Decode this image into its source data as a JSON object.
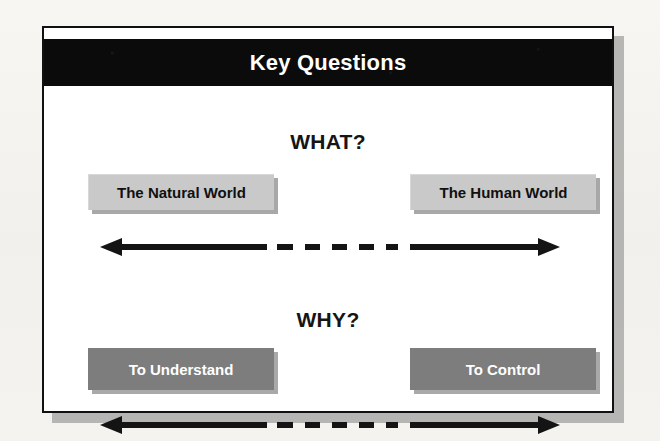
{
  "slide": {
    "title": "Key Questions",
    "sections": [
      {
        "id": "what",
        "heading": "WHAT?",
        "left_label": "The Natural World",
        "right_label": "The Human World",
        "box_style": "light",
        "box_fill": "#c9c9c9",
        "box_text_color": "#101010",
        "connector": "double-headed-dashed-arrow"
      },
      {
        "id": "why",
        "heading": "WHY?",
        "left_label": "To Understand",
        "right_label": "To Control",
        "box_style": "dark",
        "box_fill": "#7d7d7d",
        "box_text_color": "#ffffff",
        "connector": "double-headed-dashed-arrow"
      }
    ]
  },
  "colors": {
    "page_background": "#f3f2ef",
    "slide_background": "#ffffff",
    "slide_border": "#111111",
    "slide_shadow": "#9e9e9c",
    "title_bar_background": "#0b0b0b",
    "title_bar_text": "#ffffff",
    "heading_text": "#151515",
    "arrow": "#141414"
  },
  "arrow_dashes": 5
}
